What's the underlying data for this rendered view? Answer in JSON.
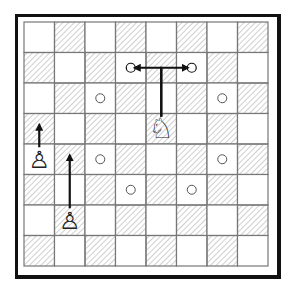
{
  "board": {
    "size": 8,
    "origin": {
      "x": 24,
      "y": 22
    },
    "cell": 30.5,
    "hatch_rule": "odd",
    "colors": {
      "light": "#ffffff",
      "hatch_line": "#9a9a9a",
      "grid": "#777777",
      "border": "#111111"
    }
  },
  "pieces": [
    {
      "type": "knight",
      "color": "white",
      "row": 3,
      "col": 4,
      "glyph": "♘"
    },
    {
      "type": "pawn",
      "color": "white",
      "row": 4,
      "col": 0,
      "glyph": "♙"
    },
    {
      "type": "pawn",
      "color": "white",
      "row": 6,
      "col": 1,
      "glyph": "♙"
    }
  ],
  "arrows": [
    {
      "name": "knight-move-left",
      "from": [
        3,
        4
      ],
      "via": [
        1,
        4
      ],
      "to": [
        1,
        3
      ],
      "target_dot": true
    },
    {
      "name": "knight-move-right",
      "from": [
        3,
        4
      ],
      "via": [
        1,
        4
      ],
      "to": [
        1,
        5
      ],
      "target_dot": true
    },
    {
      "name": "pawn-a-advance",
      "from": [
        4,
        0
      ],
      "to": [
        3,
        0
      ]
    },
    {
      "name": "pawn-b-advance",
      "from": [
        6,
        1
      ],
      "to": [
        4,
        1
      ]
    }
  ],
  "markers": [
    {
      "row": 2,
      "col": 2
    },
    {
      "row": 2,
      "col": 6
    },
    {
      "row": 4,
      "col": 2
    },
    {
      "row": 4,
      "col": 6
    },
    {
      "row": 5,
      "col": 3
    },
    {
      "row": 5,
      "col": 5
    }
  ]
}
